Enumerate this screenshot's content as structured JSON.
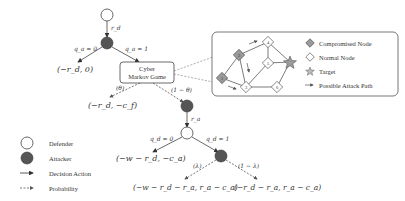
{
  "tree": {
    "root_edge_label": "r_d",
    "branch_left_label": "q_a = 0",
    "branch_right_label": "q_a = 1",
    "payoff_no_attack": "(−r_d, 0)",
    "game_box": {
      "line1": "Cyber",
      "line2": "Markov Game"
    },
    "prob_theta": "(θ)",
    "prob_one_minus_theta": "(1 − θ)",
    "payoff_theta": "(−r_d, −c_f)",
    "attacker_edge_label": "r_a",
    "defender_branch_left": "q_d = 0",
    "defender_branch_right": "q_d = 1",
    "payoff_no_defense": "(−w − r_d, −c_a)",
    "prob_lambda": "(λ)",
    "prob_one_minus_lambda": "(1 − λ)",
    "payoff_lambda": "(−w − r_d − r_a, r_a − c_a)",
    "payoff_one_minus_lambda": "(−r_d − r_a, r_a − c_a)"
  },
  "inset": {
    "nodes": [
      {
        "id": "1",
        "type": "compromised"
      },
      {
        "id": "2",
        "type": "compromised"
      },
      {
        "id": "3",
        "type": "normal"
      },
      {
        "id": "4",
        "type": "normal"
      },
      {
        "id": "5",
        "type": "normal"
      },
      {
        "id": "6",
        "type": "normal"
      },
      {
        "id": "target",
        "type": "target"
      }
    ],
    "legend": [
      {
        "icon": "compromised-node-icon",
        "label": "Compromised Node"
      },
      {
        "icon": "normal-node-icon",
        "label": "Normal Node"
      },
      {
        "icon": "target-star-icon",
        "label": "Target"
      },
      {
        "icon": "attack-path-arrow-icon",
        "label": "Possible Attack Path"
      }
    ]
  },
  "legend": [
    {
      "icon": "defender-icon",
      "label": "Defender"
    },
    {
      "icon": "attacker-icon",
      "label": "Attacker"
    },
    {
      "icon": "decision-arrow-icon",
      "label": "Decision Action"
    },
    {
      "icon": "probability-arrow-icon",
      "label": "Probability"
    }
  ],
  "colors": {
    "attacker_fill": "#555555",
    "compromised_fill": "#9a9a9a",
    "line": "#444444"
  }
}
